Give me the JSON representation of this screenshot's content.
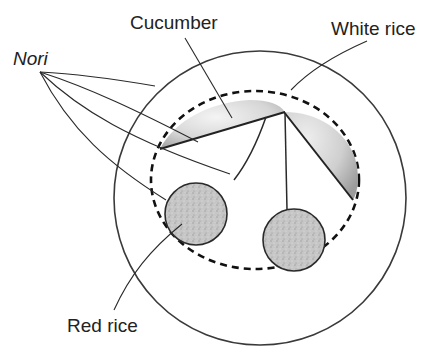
{
  "diagram": {
    "labels": {
      "nori": "Nori",
      "cucumber": "Cucumber",
      "white_rice": "White rice",
      "red_rice": "Red rice"
    },
    "colors": {
      "stroke": "#2a2a2a",
      "cucumber_fill_light": "#f2f2f2",
      "cucumber_fill_dark": "#a8a8a8",
      "red_rice_fill": "#c4c4c4",
      "background": "#ffffff"
    }
  }
}
